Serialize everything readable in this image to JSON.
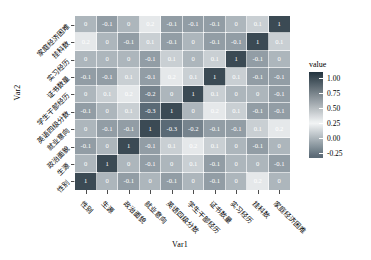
{
  "chart_data": {
    "type": "heatmap",
    "title": "",
    "xlabel": "Var1",
    "ylabel": "Var2",
    "legend_title": "value",
    "legend_position": "right",
    "grid": false,
    "zlim": [
      -0.3,
      1.0
    ],
    "legend_ticks": [
      "1.00",
      "0.75",
      "0.50",
      "0.25",
      "0.00",
      "-0.25"
    ],
    "legend_tick_values": [
      1.0,
      0.75,
      0.5,
      0.25,
      0.0,
      -0.25
    ],
    "x_categories": [
      "性别",
      "生源",
      "政治面貌",
      "就业意向",
      "英语四级分数",
      "学生干部经历",
      "证书数量",
      "实习经历",
      "挂科数",
      "家庭经济困难"
    ],
    "y_categories": [
      "家庭经济困难",
      "挂科数",
      "实习经历",
      "证书数量",
      "学生干部经历",
      "英语四级分数",
      "就业意向",
      "政治面貌",
      "生源",
      "性别"
    ],
    "values": [
      [
        0,
        -0.1,
        0,
        0.2,
        -0.1,
        -0.1,
        -0.1,
        0,
        0.1,
        1
      ],
      [
        0.2,
        0,
        -0.1,
        0.1,
        -0.1,
        0,
        -0.1,
        -0.1,
        1,
        0.1
      ],
      [
        0,
        0,
        0,
        -0.1,
        0.1,
        0,
        0.1,
        1,
        -0.1,
        0
      ],
      [
        -0.1,
        -0.1,
        0.1,
        -0.1,
        0.2,
        0.1,
        1,
        0.1,
        -0.1,
        -0.1
      ],
      [
        0,
        0.1,
        0.2,
        -0.2,
        0,
        1,
        0.1,
        0,
        0,
        -0.1
      ],
      [
        -0.1,
        0,
        0.1,
        -0.3,
        1,
        0,
        0.2,
        0.1,
        -0.1,
        -0.1
      ],
      [
        0,
        -0.1,
        -0.1,
        1,
        -0.3,
        -0.2,
        -0.1,
        -0.1,
        0.1,
        0.2
      ],
      [
        -0.1,
        0,
        1,
        -0.1,
        0.1,
        0.2,
        0.1,
        0,
        -0.1,
        0
      ],
      [
        0,
        1,
        0,
        -0.1,
        0,
        0.1,
        -0.1,
        0,
        0,
        -0.1
      ],
      [
        1,
        0,
        -0.1,
        0,
        -0.1,
        0,
        -0.1,
        0,
        0.2,
        0
      ]
    ],
    "labels": [
      [
        "0",
        "-0.1",
        "0",
        "0.2",
        "-0.1",
        "-0.1",
        "-0.1",
        "0",
        "0.1",
        "1"
      ],
      [
        "0.2",
        "0",
        "-0.1",
        "0.1",
        "-0.1",
        "0",
        "-0.1",
        "-0.1",
        "1",
        "0.1"
      ],
      [
        "0",
        "0",
        "0",
        "-0.1",
        "0.1",
        "0",
        "0.1",
        "1",
        "-0.1",
        "0"
      ],
      [
        "-0.1",
        "-0.1",
        "0.1",
        "-0.1",
        "0.2",
        "0.1",
        "1",
        "0.1",
        "-0.1",
        "-0.1"
      ],
      [
        "0",
        "0.1",
        "0.2",
        "-0.2",
        "0",
        "1",
        "0.1",
        "0",
        "0",
        "-0.1"
      ],
      [
        "-0.1",
        "0",
        "0.1",
        "-0.3",
        "1",
        "0",
        "0.2",
        "0.1",
        "-0.1",
        "-0.1"
      ],
      [
        "0",
        "-0.1",
        "-0.1",
        "1",
        "-0.3",
        "-0.2",
        "-0.1",
        "-0.1",
        "0.1",
        "0.2"
      ],
      [
        "-0.1",
        "0",
        "1",
        "-0.1",
        "0.1",
        "0.2",
        "0.1",
        "0",
        "-0.1",
        "0"
      ],
      [
        "0",
        "1",
        "0",
        "-0.1",
        "0",
        "0.1",
        "-0.1",
        "0",
        "0",
        "-0.1"
      ],
      [
        "1",
        "0",
        "-0.1",
        "0",
        "-0.1",
        "0",
        "-0.1",
        "0",
        "0.2",
        "0"
      ]
    ],
    "colors": {
      "high": "#3b4a54",
      "mid_light": "#f2f4f5",
      "low": "#5a6b75"
    }
  }
}
